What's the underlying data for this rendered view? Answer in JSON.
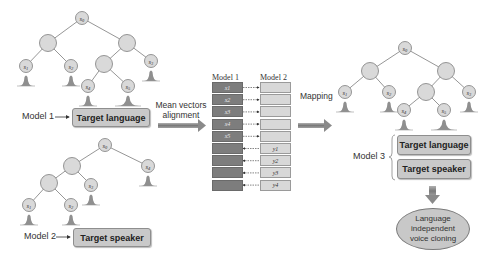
{
  "diagram": {
    "tree1": {
      "nodes": [
        {
          "id": "root",
          "label": "s0",
          "x": 82,
          "y": 18
        },
        {
          "id": "n1",
          "label": "",
          "x": 48,
          "y": 43
        },
        {
          "id": "n2",
          "label": "",
          "x": 127,
          "y": 43
        },
        {
          "id": "l1",
          "label": "s1",
          "x": 26,
          "y": 66
        },
        {
          "id": "l2",
          "label": "s2",
          "x": 71,
          "y": 66
        },
        {
          "id": "n3",
          "label": "",
          "x": 104,
          "y": 64
        },
        {
          "id": "l3",
          "label": "s3",
          "x": 151,
          "y": 61
        },
        {
          "id": "l4",
          "label": "s4",
          "x": 88,
          "y": 86
        },
        {
          "id": "l5",
          "label": "s5",
          "x": 128,
          "y": 86
        }
      ],
      "edges": [
        [
          "root",
          "n1"
        ],
        [
          "root",
          "n2"
        ],
        [
          "n1",
          "l1"
        ],
        [
          "n1",
          "l2"
        ],
        [
          "n2",
          "n3"
        ],
        [
          "n2",
          "l3"
        ],
        [
          "n3",
          "l4"
        ],
        [
          "n3",
          "l5"
        ]
      ],
      "model_label": "Model 1",
      "target_box": "Target language"
    },
    "tree2": {
      "nodes": [
        {
          "id": "root",
          "label": "s0",
          "x": 105,
          "y": 145
        },
        {
          "id": "n1",
          "label": "",
          "x": 72,
          "y": 166
        },
        {
          "id": "l4",
          "label": "s4",
          "x": 148,
          "y": 166
        },
        {
          "id": "n2",
          "label": "",
          "x": 49,
          "y": 183
        },
        {
          "id": "l3",
          "label": "s3",
          "x": 91,
          "y": 185
        },
        {
          "id": "l1",
          "label": "s1",
          "x": 29,
          "y": 205
        },
        {
          "id": "l2",
          "label": "s2",
          "x": 71,
          "y": 205
        }
      ],
      "edges": [
        [
          "root",
          "n1"
        ],
        [
          "root",
          "l4"
        ],
        [
          "n1",
          "n2"
        ],
        [
          "n1",
          "l3"
        ],
        [
          "n2",
          "l1"
        ],
        [
          "n2",
          "l2"
        ]
      ],
      "model_label": "Model 2",
      "target_box": "Target speaker"
    },
    "alignment": {
      "label_line1": "Mean vectors",
      "label_line2": "alignment",
      "col1_header": "Model 1",
      "col2_header": "Model 2",
      "rows": [
        {
          "left": "x1",
          "right": "",
          "dir": "right"
        },
        {
          "left": "x2",
          "right": "",
          "dir": "right"
        },
        {
          "left": "x3",
          "right": "",
          "dir": "right"
        },
        {
          "left": "x4",
          "right": "",
          "dir": "right"
        },
        {
          "left": "x5",
          "right": "",
          "dir": "right"
        },
        {
          "left": "",
          "right": "y1",
          "dir": "left"
        },
        {
          "left": "",
          "right": "y2",
          "dir": "left"
        },
        {
          "left": "",
          "right": "y3",
          "dir": "left"
        },
        {
          "left": "",
          "right": "y4",
          "dir": "left"
        }
      ]
    },
    "mapping_label": "Mapping",
    "tree3": {
      "nodes": [
        {
          "id": "root",
          "label": "s0",
          "x": 405,
          "y": 48
        },
        {
          "id": "n1",
          "label": "",
          "x": 370,
          "y": 71
        },
        {
          "id": "n2",
          "label": "",
          "x": 446,
          "y": 71
        },
        {
          "id": "l1",
          "label": "s1",
          "x": 345,
          "y": 92
        },
        {
          "id": "l2",
          "label": "s2",
          "x": 389,
          "y": 92
        },
        {
          "id": "n3",
          "label": "",
          "x": 426,
          "y": 92
        },
        {
          "id": "l3",
          "label": "s3",
          "x": 469,
          "y": 92
        },
        {
          "id": "l4",
          "label": "s4",
          "x": 404,
          "y": 110
        },
        {
          "id": "l5",
          "label": "s5",
          "x": 444,
          "y": 110
        }
      ],
      "edges": [
        [
          "root",
          "n1"
        ],
        [
          "root",
          "n2"
        ],
        [
          "n1",
          "l1"
        ],
        [
          "n1",
          "l2"
        ],
        [
          "n2",
          "n3"
        ],
        [
          "n2",
          "l3"
        ],
        [
          "n3",
          "l4"
        ],
        [
          "n3",
          "l5"
        ]
      ]
    },
    "model3": {
      "label": "Model 3",
      "box1": "Target language",
      "box2": "Target speaker"
    },
    "output": {
      "line1": "Language",
      "line2": "independent",
      "line3": "voice cloning"
    },
    "colors": {
      "node_fill": "#d9d9d9",
      "node_stroke": "#8a8a8a",
      "box_fill": "#c9c9c9",
      "arrow_fill": "#8c8c8c",
      "dark_vec": "#7d7d7d",
      "light_vec": "#d8d8d8"
    }
  }
}
